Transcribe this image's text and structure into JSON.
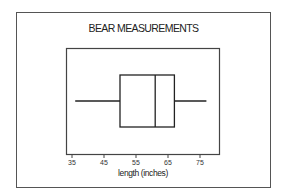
{
  "chart_data": {
    "type": "boxplot",
    "title": "BEAR MEASUREMENTS",
    "xlabel": "length (inches)",
    "ylabel": "",
    "orientation": "horizontal",
    "xticks": [
      35,
      45,
      55,
      65,
      75
    ],
    "xlim": [
      33,
      81
    ],
    "grid": false,
    "legend": null,
    "boxes": [
      {
        "name": "length",
        "min": 36,
        "q1": 50,
        "median": 61,
        "q3": 67,
        "max": 77
      }
    ]
  },
  "colors": {
    "stroke": "#222222",
    "frame": "#555555",
    "background": "#ffffff"
  }
}
